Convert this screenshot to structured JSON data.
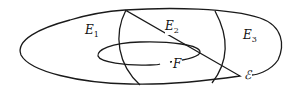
{
  "diagram": {
    "regions": [
      {
        "name": "E",
        "sub": "1"
      },
      {
        "name": "E",
        "sub": "2"
      },
      {
        "name": "E",
        "sub": "3"
      }
    ],
    "inner_set": "F",
    "outer_set": "ℰ",
    "stroke_color": "#1a1a1a"
  }
}
